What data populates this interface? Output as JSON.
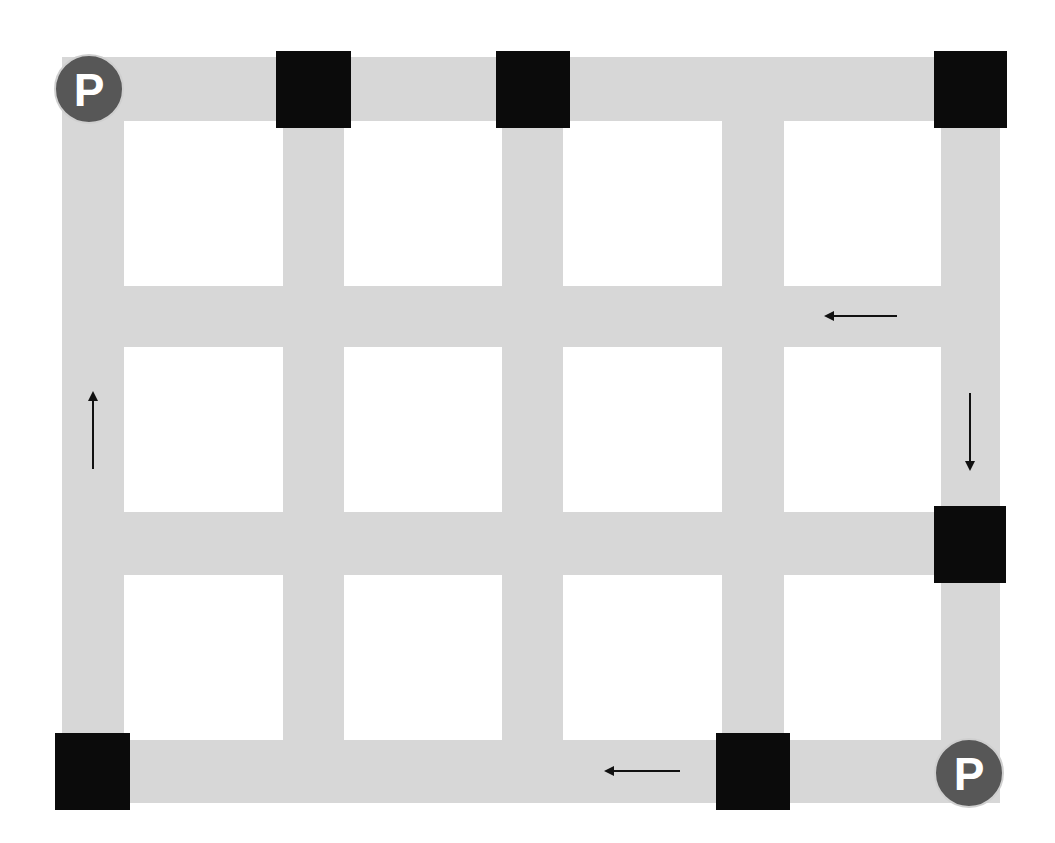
{
  "diagram": {
    "type": "street-grid-route",
    "canvas": {
      "width": 1055,
      "height": 843,
      "background": "#ffffff"
    },
    "colors": {
      "road": "#d7d7d7",
      "block": "#0b0b0b",
      "parking_fill": "#575757",
      "parking_border": "#cfcfcf",
      "parking_text": "#ffffff",
      "arrow": "#111111"
    },
    "vertical_roads": [
      {
        "id": "v1",
        "x": 62,
        "width": 62,
        "y": 57,
        "height": 746
      },
      {
        "id": "v2",
        "x": 283,
        "width": 61,
        "y": 57,
        "height": 746
      },
      {
        "id": "v3",
        "x": 502,
        "width": 61,
        "y": 57,
        "height": 746
      },
      {
        "id": "v4",
        "x": 722,
        "width": 62,
        "y": 57,
        "height": 746
      },
      {
        "id": "v5",
        "x": 941,
        "width": 59,
        "y": 57,
        "height": 746
      }
    ],
    "horizontal_roads": [
      {
        "id": "h1",
        "y": 57,
        "height": 64,
        "x": 62,
        "width": 938
      },
      {
        "id": "h2",
        "y": 286,
        "height": 61,
        "x": 62,
        "width": 938
      },
      {
        "id": "h3",
        "y": 512,
        "height": 63,
        "x": 62,
        "width": 938
      },
      {
        "id": "h4",
        "y": 740,
        "height": 63,
        "x": 62,
        "width": 938
      }
    ],
    "blocks": [
      {
        "id": "block-top-2",
        "x": 276,
        "y": 51,
        "w": 75,
        "h": 77
      },
      {
        "id": "block-top-3",
        "x": 496,
        "y": 51,
        "w": 74,
        "h": 77
      },
      {
        "id": "block-top-right",
        "x": 934,
        "y": 51,
        "w": 73,
        "h": 77
      },
      {
        "id": "block-right-mid",
        "x": 934,
        "y": 506,
        "w": 72,
        "h": 77
      },
      {
        "id": "block-bottom-left",
        "x": 55,
        "y": 733,
        "w": 75,
        "h": 77
      },
      {
        "id": "block-bottom-4",
        "x": 716,
        "y": 733,
        "w": 74,
        "h": 77
      }
    ],
    "parking": [
      {
        "id": "parking-top-left",
        "label": "P",
        "cx": 89,
        "cy": 89,
        "r": 35
      },
      {
        "id": "parking-bottom-right",
        "label": "P",
        "cx": 969,
        "cy": 773,
        "r": 35
      }
    ],
    "arrows": [
      {
        "id": "arrow-left-upper",
        "direction": "left",
        "x1": 897,
        "y1": 316,
        "x2": 826,
        "y2": 316
      },
      {
        "id": "arrow-down-right",
        "direction": "down",
        "x1": 970,
        "y1": 393,
        "x2": 970,
        "y2": 469
      },
      {
        "id": "arrow-up-left",
        "direction": "up",
        "x1": 93,
        "y1": 469,
        "x2": 93,
        "y2": 393
      },
      {
        "id": "arrow-left-bottom",
        "direction": "left",
        "x1": 680,
        "y1": 771,
        "x2": 606,
        "y2": 771
      }
    ]
  }
}
